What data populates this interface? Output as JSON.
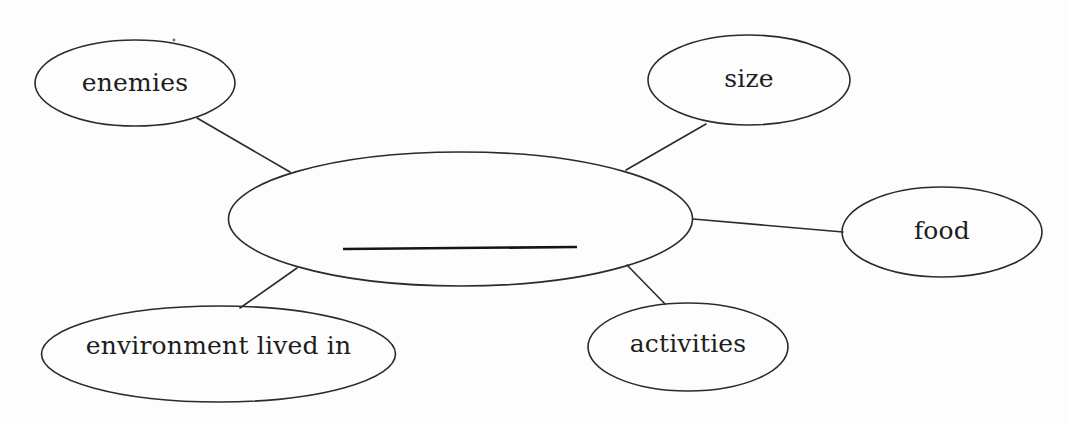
{
  "diagram": {
    "type": "concept-web",
    "title_text": "",
    "center": {
      "label": "",
      "blank_line": true,
      "note": "empty center oval containing a blank write-in line"
    },
    "nodes": [
      {
        "id": "enemies",
        "label": "enemies"
      },
      {
        "id": "size",
        "label": "size"
      },
      {
        "id": "food",
        "label": "food"
      },
      {
        "id": "environment",
        "label": "environment lived in"
      },
      {
        "id": "activities",
        "label": "activities"
      }
    ],
    "colors": {
      "stroke": "#2b2b2b",
      "background": "#fdfdfd",
      "text": "#1d1d1d"
    }
  }
}
